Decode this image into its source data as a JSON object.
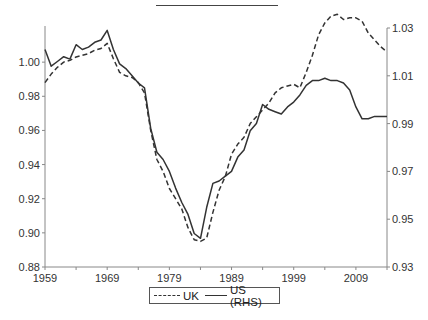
{
  "chart_data": {
    "type": "line",
    "title": "",
    "xlabel": "",
    "ylabel_left": "",
    "ylabel_right": "",
    "x_ticks": [
      "1959",
      "1969",
      "1979",
      "1989",
      "1999",
      "2009"
    ],
    "x_range": [
      1959,
      2014
    ],
    "y_left": {
      "ticks": [
        "0.88",
        "0.90",
        "0.92",
        "0.94",
        "0.96",
        "0.98",
        "1.00"
      ],
      "range": [
        0.88,
        1.02
      ]
    },
    "y_right": {
      "ticks": [
        "0.93",
        "0.95",
        "0.97",
        "0.99",
        "1.01",
        "1.03"
      ],
      "range": [
        0.93,
        1.03
      ]
    },
    "grid": false,
    "legend_position": "bottom",
    "x": [
      1959,
      1960,
      1961,
      1962,
      1963,
      1964,
      1965,
      1966,
      1967,
      1968,
      1969,
      1970,
      1971,
      1972,
      1973,
      1974,
      1975,
      1976,
      1977,
      1978,
      1979,
      1980,
      1981,
      1982,
      1983,
      1984,
      1985,
      1986,
      1987,
      1988,
      1989,
      1990,
      1991,
      1992,
      1993,
      1994,
      1995,
      1996,
      1997,
      1998,
      1999,
      2000,
      2001,
      2002,
      2003,
      2004,
      2005,
      2006,
      2007,
      2008,
      2009,
      2010,
      2011,
      2012,
      2013,
      2014
    ],
    "series": [
      {
        "name": "UK",
        "axis": "left",
        "style": "dashed",
        "values": [
          0.988,
          0.993,
          0.997,
          1.0,
          1.001,
          1.003,
          1.004,
          1.005,
          1.007,
          1.008,
          1.011,
          1.002,
          0.994,
          0.992,
          0.991,
          0.988,
          0.982,
          0.96,
          0.943,
          0.936,
          0.926,
          0.92,
          0.914,
          0.903,
          0.896,
          0.895,
          0.897,
          0.912,
          0.925,
          0.933,
          0.946,
          0.952,
          0.956,
          0.964,
          0.968,
          0.972,
          0.976,
          0.982,
          0.985,
          0.986,
          0.987,
          0.985,
          0.994,
          1.004,
          1.016,
          1.023,
          1.027,
          1.028,
          1.025,
          1.026,
          1.026,
          1.024,
          1.017,
          1.013,
          1.009,
          1.006
        ]
      },
      {
        "name": "US (RHS)",
        "axis": "right",
        "style": "solid",
        "values": [
          1.021,
          1.014,
          1.016,
          1.018,
          1.017,
          1.023,
          1.021,
          1.022,
          1.024,
          1.025,
          1.029,
          1.021,
          1.015,
          1.013,
          1.01,
          1.007,
          1.005,
          0.988,
          0.978,
          0.975,
          0.97,
          0.963,
          0.957,
          0.952,
          0.944,
          0.942,
          0.955,
          0.965,
          0.966,
          0.968,
          0.97,
          0.976,
          0.979,
          0.987,
          0.99,
          0.998,
          0.996,
          0.995,
          0.994,
          0.997,
          0.999,
          1.002,
          1.006,
          1.008,
          1.008,
          1.009,
          1.008,
          1.008,
          1.007,
          1.004,
          0.997,
          0.992,
          0.992,
          0.993,
          0.993,
          0.993
        ]
      }
    ]
  },
  "legend": {
    "uk_label": "UK",
    "us_label": "US (RHS)"
  },
  "colors": {
    "line": "#333333",
    "axis": "#888888"
  }
}
